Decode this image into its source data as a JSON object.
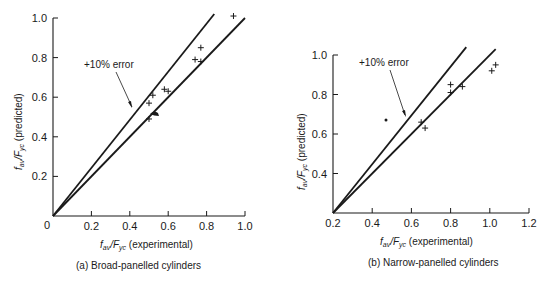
{
  "chart_data": [
    {
      "type": "scatter",
      "title": "(a) Broad-panelled cylinders",
      "xlabel": "f_av / F_yc (experimental)",
      "ylabel": "f_av / F_yc (predicted)",
      "xlim": [
        0,
        1.0
      ],
      "ylim": [
        0,
        1.0
      ],
      "xticks": [
        "0",
        "0.2",
        "0.4",
        "0.6",
        "0.8",
        "1.0"
      ],
      "yticks": [
        "0.2",
        "0.4",
        "0.6",
        "0.8",
        "1.0"
      ],
      "grid": false,
      "annotation": "+10% error",
      "lines": [
        {
          "name": "+10% error",
          "x": [
            0,
            0.84
          ],
          "y": [
            0,
            1.02
          ]
        },
        {
          "name": "exact",
          "x": [
            0,
            1.0
          ],
          "y": [
            0,
            1.0
          ]
        }
      ],
      "series": [
        {
          "name": "data",
          "marker": "+",
          "x": [
            0.5,
            0.52,
            0.58,
            0.6,
            0.5,
            0.74,
            0.77,
            0.77,
            0.94
          ],
          "y": [
            0.57,
            0.61,
            0.64,
            0.63,
            0.49,
            0.79,
            0.78,
            0.85,
            1.01
          ]
        }
      ]
    },
    {
      "type": "scatter",
      "title": "(b) Narrow-panelled cylinders",
      "xlabel": "f_av / F_yc (experimental)",
      "ylabel": "f_av / F_yc (predicted)",
      "xlim": [
        0.2,
        1.2
      ],
      "ylim": [
        0.2,
        1.0
      ],
      "xticks": [
        "0.2",
        "0.4",
        "0.6",
        "0.8",
        "1.0",
        "1.2"
      ],
      "yticks": [
        "0.4",
        "0.6",
        "0.8",
        "1.0"
      ],
      "grid": false,
      "annotation": "+10% error",
      "lines": [
        {
          "name": "+10% error",
          "x": [
            0.2,
            0.88
          ],
          "y": [
            0.2,
            1.04
          ]
        },
        {
          "name": "exact",
          "x": [
            0.2,
            1.03
          ],
          "y": [
            0.2,
            1.03
          ]
        }
      ],
      "series": [
        {
          "name": "data",
          "marker": "+",
          "x": [
            0.65,
            0.67,
            0.8,
            0.8,
            0.86,
            1.01,
            1.03
          ],
          "y": [
            0.66,
            0.63,
            0.85,
            0.81,
            0.84,
            0.92,
            0.95
          ]
        }
      ]
    }
  ],
  "labels": {
    "a": {
      "caption": "(a) Broad-panelled cylinders",
      "xlabel_main": "f",
      "xlabel_sub1": "av",
      "xlabel_mid": "/F",
      "xlabel_sub2": "yc",
      "xlabel_tail": " (experimental)",
      "ylabel_tail": " (predicted)",
      "annotation": "+10% error",
      "origin": "0"
    },
    "b": {
      "caption": "(b) Narrow-panelled cylinders",
      "xlabel_tail": " (experimental)",
      "ylabel_tail": " (predicted)",
      "annotation": "+10% error"
    }
  }
}
